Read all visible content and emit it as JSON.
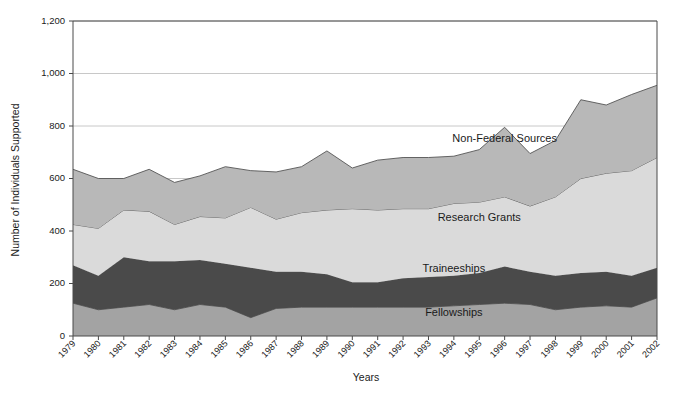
{
  "chart_data": {
    "type": "area",
    "stacked": true,
    "title": "",
    "xlabel": "Years",
    "ylabel": "Number of Individuals Supported",
    "ylim": [
      0,
      1200
    ],
    "ytick_step": 200,
    "ytick_labels": [
      "0",
      "200",
      "400",
      "600",
      "800",
      "1,000",
      "1,200"
    ],
    "ytick_values": [
      0,
      200,
      400,
      600,
      800,
      1000,
      1200
    ],
    "grid": true,
    "legend_position": "inline-annotations",
    "categories": [
      "1979",
      "1980",
      "1981",
      "1982",
      "1983",
      "1984",
      "1985",
      "1986",
      "1987",
      "1988",
      "1989",
      "1990",
      "1991",
      "1992",
      "1993",
      "1994",
      "1995",
      "1996",
      "1997",
      "1998",
      "1999",
      "2000",
      "2001",
      "2002"
    ],
    "series": [
      {
        "name": "Fellowships",
        "color": "#a3a3a3",
        "values": [
          125,
          100,
          110,
          120,
          100,
          120,
          110,
          70,
          105,
          110,
          110,
          110,
          110,
          110,
          110,
          115,
          120,
          125,
          120,
          100,
          110,
          115,
          110,
          145
        ]
      },
      {
        "name": "Traineeships",
        "color": "#4a4a4a",
        "values": [
          145,
          130,
          190,
          165,
          185,
          170,
          165,
          190,
          140,
          135,
          125,
          95,
          95,
          110,
          115,
          115,
          120,
          140,
          125,
          130,
          130,
          130,
          120,
          115
        ]
      },
      {
        "name": "Research Grants",
        "color": "#dadada",
        "values": [
          155,
          180,
          180,
          190,
          140,
          165,
          175,
          230,
          200,
          225,
          245,
          280,
          275,
          265,
          260,
          275,
          270,
          265,
          250,
          300,
          360,
          375,
          400,
          420
        ]
      },
      {
        "name": "Non-Federal Sources",
        "color": "#b8b8b8",
        "values": [
          210,
          190,
          120,
          160,
          160,
          155,
          195,
          140,
          180,
          175,
          225,
          155,
          190,
          195,
          195,
          180,
          200,
          265,
          200,
          215,
          300,
          260,
          290,
          275
        ]
      }
    ],
    "totals": [
      635,
      600,
      600,
      635,
      585,
      610,
      645,
      630,
      625,
      645,
      705,
      640,
      670,
      680,
      680,
      685,
      710,
      795,
      695,
      745,
      900,
      880,
      920,
      955
    ],
    "annotations": [
      {
        "text": "Non-Federal Sources",
        "x": 1996,
        "y": 740
      },
      {
        "text": "Research Grants",
        "x": 1995,
        "y": 440
      },
      {
        "text": "Traineeships",
        "x": 1994,
        "y": 245
      },
      {
        "text": "Fellowships",
        "x": 1994,
        "y": 75
      }
    ]
  }
}
